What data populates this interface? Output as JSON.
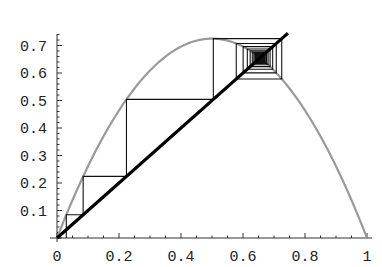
{
  "chart_data": {
    "type": "line",
    "title": "",
    "subtitle": "",
    "xlabel": "",
    "ylabel": "",
    "map": {
      "r": 2.9,
      "x0": 0.03,
      "iterations": 60
    },
    "series": [
      {
        "name": "f(x) = r x (1 - x)",
        "color": "#9a9a9a",
        "x_range": [
          0,
          1
        ],
        "style": "curve"
      },
      {
        "name": "y = x",
        "color": "#000000",
        "x_range": [
          0,
          0.745
        ],
        "style": "thick-line"
      },
      {
        "name": "cobweb",
        "color": "#000000",
        "style": "thin-polyline",
        "points_first": [
          [
            0.03,
            0
          ],
          [
            0.03,
            0.0844
          ],
          [
            0.0844,
            0.0844
          ],
          [
            0.0844,
            0.2242
          ],
          [
            0.2242,
            0.2242
          ],
          [
            0.2242,
            0.5044
          ],
          [
            0.5044,
            0.5044
          ],
          [
            0.5044,
            0.725
          ],
          [
            0.725,
            0.725
          ],
          [
            0.725,
            0.578
          ],
          [
            0.578,
            0.578
          ],
          [
            0.578,
            0.707
          ]
        ]
      }
    ],
    "fixed_point": 0.655,
    "xlim": [
      0,
      1
    ],
    "ylim": [
      0,
      0.75
    ],
    "xticks": [
      0,
      0.2,
      0.4,
      0.6,
      0.8,
      1
    ],
    "xtick_labels": [
      "0",
      "0.2",
      "0.4",
      "0.6",
      "0.8",
      "1"
    ],
    "yticks": [
      0.1,
      0.2,
      0.3,
      0.4,
      0.5,
      0.6,
      0.7
    ],
    "ytick_labels": [
      "0.1",
      "0.2",
      "0.3",
      "0.4",
      "0.5",
      "0.6",
      "0.7"
    ],
    "grid": false,
    "legend": null
  }
}
